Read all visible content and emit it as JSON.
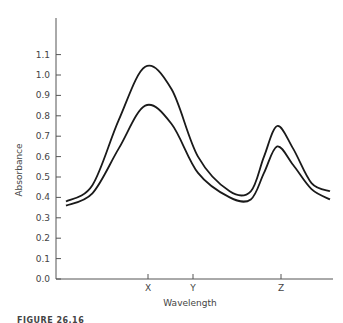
{
  "chart_data": {
    "type": "line",
    "title": "",
    "xlabel": "Wavelength",
    "ylabel": "Absorbance",
    "ylim": [
      0.0,
      1.1
    ],
    "yticks": [
      "0.0",
      "0.1",
      "0.2",
      "0.3",
      "0.4",
      "0.5",
      "0.6",
      "0.7",
      "0.8",
      "0.9",
      "1.0",
      "1.1"
    ],
    "xticks": [
      {
        "label": "X",
        "pos": 0.3
      },
      {
        "label": "Y",
        "pos": 0.47
      },
      {
        "label": "Z",
        "pos": 0.8
      }
    ],
    "grid": false,
    "legend": null,
    "series": [
      {
        "name": "upper curve",
        "x": [
          0.0,
          0.1,
          0.2,
          0.3,
          0.4,
          0.5,
          0.62,
          0.7,
          0.75,
          0.8,
          0.86,
          0.93,
          1.0
        ],
        "values": [
          0.38,
          0.46,
          0.78,
          1.04,
          0.93,
          0.6,
          0.43,
          0.43,
          0.6,
          0.75,
          0.64,
          0.47,
          0.43
        ]
      },
      {
        "name": "lower curve",
        "x": [
          0.0,
          0.1,
          0.2,
          0.3,
          0.4,
          0.5,
          0.62,
          0.7,
          0.75,
          0.8,
          0.86,
          0.93,
          1.0
        ],
        "values": [
          0.36,
          0.42,
          0.64,
          0.85,
          0.76,
          0.52,
          0.4,
          0.39,
          0.52,
          0.65,
          0.56,
          0.44,
          0.39
        ]
      }
    ]
  },
  "caption": "FIGURE 26.16"
}
